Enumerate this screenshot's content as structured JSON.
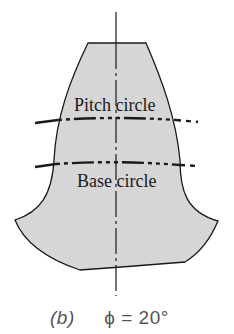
{
  "figure": {
    "labels": {
      "pitch_circle": "Pitch circle",
      "base_circle": "Base circle"
    },
    "caption": {
      "part": "(b)",
      "equation": "ϕ = 20°"
    },
    "colors": {
      "tooth_fill": "#d6d6d6",
      "outline": "#1a1a1a",
      "caption": "#555555"
    },
    "pressure_angle_deg": 20
  }
}
